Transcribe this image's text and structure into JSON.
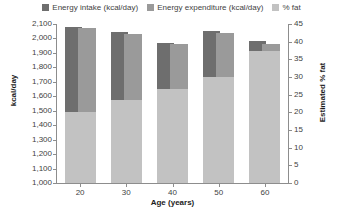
{
  "legend": {
    "items": [
      {
        "label": "Energy intake (kcal/day)",
        "color": "#6e6e6e",
        "key": "intake"
      },
      {
        "label": "Energy expenditure (kcal/day)",
        "color": "#9a9a9a",
        "key": "expenditure"
      },
      {
        "label": "% fat",
        "color": "#c2c2c2",
        "key": "fat"
      }
    ]
  },
  "axes": {
    "left": {
      "title": "kcal/day",
      "ticks": [
        "2,100",
        "2,000",
        "1,900",
        "1,800",
        "1,700",
        "1,600",
        "1,500",
        "1,400",
        "1,300",
        "1,200",
        "1,100",
        "1,000"
      ]
    },
    "right": {
      "title": "Estimated % fat",
      "ticks": [
        "45",
        "40",
        "35",
        "30",
        "25",
        "20",
        "15",
        "10",
        "5",
        "0"
      ]
    },
    "bottom": {
      "title": "Age (years)",
      "ticks": [
        "20",
        "30",
        "40",
        "50",
        "60"
      ]
    }
  },
  "chart_data": {
    "type": "bar",
    "title": "",
    "xlabel": "Age (years)",
    "ylabel": "kcal/day",
    "y2label": "Estimated % fat",
    "grid": false,
    "legend_position": "top-center",
    "categories": [
      "20",
      "30",
      "40",
      "50",
      "60"
    ],
    "ylim": [
      1000,
      2100
    ],
    "y2lim": [
      0,
      45
    ],
    "yticks": [
      1000,
      1100,
      1200,
      1300,
      1400,
      1500,
      1600,
      1700,
      1800,
      1900,
      2000,
      2100
    ],
    "y2ticks": [
      0,
      5,
      10,
      15,
      20,
      25,
      30,
      35,
      40,
      45
    ],
    "series": [
      {
        "name": "Energy intake (kcal/day)",
        "axis": "left",
        "color": "#6e6e6e",
        "values": [
          2080,
          2045,
          1970,
          2050,
          1985
        ]
      },
      {
        "name": "Energy expenditure (kcal/day)",
        "axis": "left",
        "color": "#9a9a9a",
        "values": [
          2070,
          2030,
          1960,
          2040,
          1960
        ]
      },
      {
        "name": "% fat",
        "axis": "right",
        "color": "#c2c2c2",
        "values": [
          20.0,
          23.5,
          26.5,
          30.0,
          37.5
        ]
      }
    ]
  }
}
